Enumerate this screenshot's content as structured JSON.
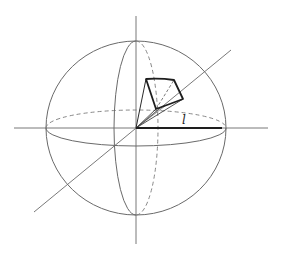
{
  "diagram": {
    "type": "solid-angle-sphere",
    "radius_label": "l",
    "colors": {
      "background": "#ffffff",
      "thin_line": "#6a6a6a",
      "thick_line": "#1e1e1e",
      "dashed_line": "#7a7a7a"
    },
    "geometry": {
      "center": [
        136,
        128
      ],
      "sphere_rx": 90,
      "sphere_ry": 87,
      "equator_ry": 18,
      "meridian_rx": 22,
      "axes": {
        "horizontal": [
          [
            14,
            128
          ],
          [
            268,
            128
          ]
        ],
        "vertical": [
          [
            136,
            16
          ],
          [
            136,
            244
          ]
        ],
        "diagonal": [
          [
            34,
            212
          ],
          [
            231,
            50
          ]
        ]
      },
      "patch": [
        [
          146,
          79
        ],
        [
          174,
          80
        ],
        [
          183,
          99
        ],
        [
          156,
          109
        ]
      ],
      "radius_line": [
        [
          136,
          128
        ],
        [
          222,
          128
        ]
      ],
      "label_pos": [
        182,
        124
      ]
    }
  }
}
